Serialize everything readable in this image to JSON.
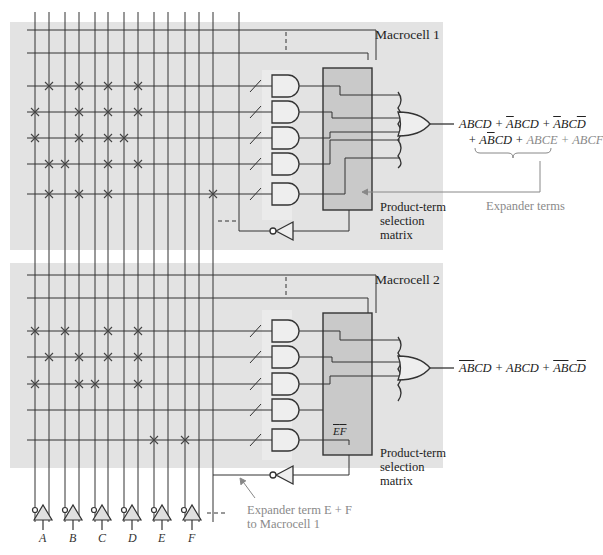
{
  "macrocell1": {
    "title": "Macrocell 1",
    "matrix_label": [
      "Product-term",
      "selection",
      "matrix"
    ],
    "expression_line1": [
      {
        "t": "ABCD + ",
        "bar": ""
      },
      {
        "t": "A",
        "bar": "1"
      },
      {
        "t": "BCD + ",
        "bar": ""
      },
      {
        "t": "A",
        "bar": "1"
      },
      {
        "t": "BC",
        "bar": ""
      },
      {
        "t": "D",
        "bar": "1"
      }
    ],
    "expr1_a": "ABCD + ",
    "expr1_b": "A",
    "expr1_c": "BCD + ",
    "expr1_d": "A",
    "expr1_e": "BC",
    "expr1_f": "D",
    "expr2_a": "+ A",
    "expr2_b": "B",
    "expr2_c": "CD + ",
    "expr2_expander": "ABCE + ABCF",
    "expander_label": "Expander terms"
  },
  "macrocell2": {
    "title": "Macrocell 2",
    "matrix_label": [
      "Product-term",
      "selection",
      "matrix"
    ],
    "ef_label_e": "E",
    "ef_label_f": "F",
    "expr_a": "AB",
    "expr_b": "CD + ABCD + ",
    "expr_c": "AB",
    "expr_d": "C",
    "expr_e": "D",
    "expander_label_line1": "Expander term E + F",
    "expander_label_line2": "to Macrocell 1"
  },
  "inputs": [
    "A",
    "B",
    "C",
    "D",
    "E",
    "F"
  ],
  "colors": {
    "panel": "#e3e3e3",
    "matrix": "#c9c9c9",
    "gate_fill": "#eeeeee",
    "line": "#333333",
    "annotation": "#8a8a8a"
  }
}
